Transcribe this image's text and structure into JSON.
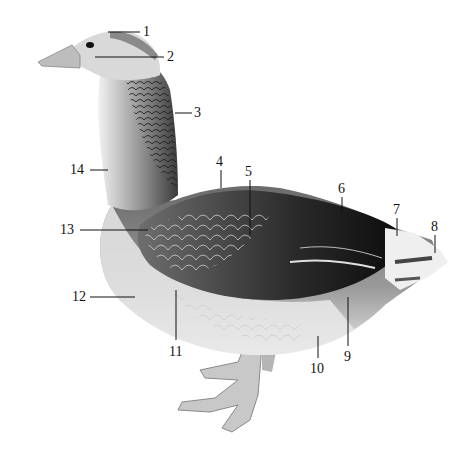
{
  "figure": {
    "labels": [
      {
        "id": "1",
        "text": "1",
        "x": 143,
        "y": 25,
        "line": [
          108,
          32,
          140,
          32
        ]
      },
      {
        "id": "2",
        "text": "2",
        "x": 167,
        "y": 50,
        "line": [
          95,
          57,
          164,
          57
        ]
      },
      {
        "id": "3",
        "text": "3",
        "x": 194,
        "y": 107,
        "line": [
          175,
          113,
          192,
          113
        ]
      },
      {
        "id": "4",
        "text": "4",
        "x": 216,
        "y": 155,
        "line": [
          221,
          170,
          221,
          188
        ]
      },
      {
        "id": "5",
        "text": "5",
        "x": 244,
        "y": 165,
        "line": [
          250,
          180,
          250,
          235
        ]
      },
      {
        "id": "6",
        "text": "6",
        "x": 338,
        "y": 182,
        "line": [
          342,
          197,
          342,
          212
        ]
      },
      {
        "id": "7",
        "text": "7",
        "x": 393,
        "y": 203,
        "line": [
          397,
          218,
          397,
          236
        ]
      },
      {
        "id": "8",
        "text": "8",
        "x": 432,
        "y": 220,
        "line": [
          435,
          235,
          435,
          253
        ]
      },
      {
        "id": "9",
        "text": "9",
        "x": 345,
        "y": 350,
        "line": [
          348,
          297,
          348,
          346
        ]
      },
      {
        "id": "10",
        "text": "10",
        "x": 312,
        "y": 362,
        "line": [
          318,
          336,
          318,
          358
        ]
      },
      {
        "id": "11",
        "text": "11",
        "x": 170,
        "y": 345,
        "line": [
          176,
          290,
          176,
          340
        ]
      },
      {
        "id": "12",
        "text": "12",
        "x": 72,
        "y": 290,
        "line": [
          90,
          297,
          135,
          297
        ]
      },
      {
        "id": "13",
        "text": "13",
        "x": 58,
        "y": 224,
        "line": [
          80,
          230,
          148,
          230
        ]
      },
      {
        "id": "14",
        "text": "14",
        "x": 68,
        "y": 164,
        "line": [
          90,
          170,
          108,
          170
        ]
      }
    ]
  }
}
